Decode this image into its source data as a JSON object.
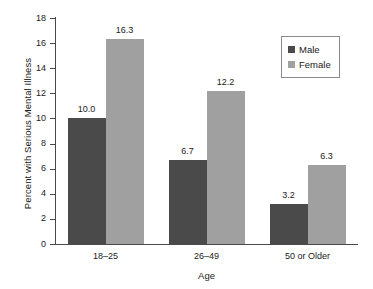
{
  "chart_data": {
    "type": "bar",
    "title": "",
    "xlabel": "Age",
    "ylabel": "Percent with Serious Mental Illness",
    "categories": [
      "18–25",
      "26–49",
      "50 or Older"
    ],
    "series": [
      {
        "name": "Male",
        "color": "#4a4a4a",
        "values": [
          10.0,
          6.7,
          3.2
        ],
        "labels": [
          "10.0",
          "6.7",
          "3.2"
        ]
      },
      {
        "name": "Female",
        "color": "#a0a0a0",
        "values": [
          16.3,
          12.2,
          6.3
        ],
        "labels": [
          "16.3",
          "12.2",
          "6.3"
        ]
      }
    ],
    "ylim": [
      0,
      18
    ],
    "ytick_step": 2,
    "yticks": [
      "18",
      "16",
      "14",
      "12",
      "10",
      "8",
      "6",
      "4",
      "2",
      "0"
    ],
    "grid": false,
    "legend_position": "top-right",
    "legend": [
      "Male",
      "Female"
    ]
  }
}
